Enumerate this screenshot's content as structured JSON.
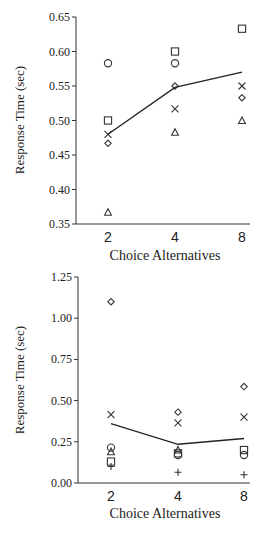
{
  "chart_data": [
    {
      "type": "scatter",
      "title": "",
      "xlabel": "Choice Alternatives",
      "ylabel": "Response Time (sec)",
      "categories": [
        "2",
        "4",
        "8"
      ],
      "ylim": [
        0.35,
        0.65
      ],
      "yticks": [
        "0.35",
        "0.40",
        "0.45",
        "0.50",
        "0.55",
        "0.60",
        "0.65"
      ],
      "grid": false,
      "legend": null,
      "series": [
        {
          "name": "circle",
          "marker": "circle",
          "values": [
            0.583,
            0.583,
            null
          ]
        },
        {
          "name": "square",
          "marker": "square",
          "values": [
            0.5,
            0.6,
            0.633
          ]
        },
        {
          "name": "cross",
          "marker": "x",
          "values": [
            0.48,
            0.517,
            0.55
          ]
        },
        {
          "name": "diamond",
          "marker": "diamond",
          "values": [
            0.467,
            0.55,
            0.533
          ]
        },
        {
          "name": "triangle",
          "marker": "triangle",
          "values": [
            0.367,
            0.483,
            0.5
          ]
        },
        {
          "name": "mean",
          "marker": "line",
          "values": [
            0.48,
            0.548,
            0.57
          ]
        }
      ]
    },
    {
      "type": "scatter",
      "title": "",
      "xlabel": "Choice Alternatives",
      "ylabel": "Response Time (sec)",
      "categories": [
        "2",
        "4",
        "8"
      ],
      "ylim": [
        0.0,
        1.25
      ],
      "yticks": [
        "0.00",
        "0.25",
        "0.50",
        "0.75",
        "1.00",
        "1.25"
      ],
      "grid": false,
      "legend": null,
      "series": [
        {
          "name": "diamond",
          "marker": "diamond",
          "values": [
            1.1,
            0.43,
            0.585
          ]
        },
        {
          "name": "cross",
          "marker": "x",
          "values": [
            0.415,
            0.365,
            0.4
          ]
        },
        {
          "name": "circle",
          "marker": "circle",
          "values": [
            0.215,
            0.17,
            0.17
          ]
        },
        {
          "name": "triangle",
          "marker": "triangle",
          "values": [
            0.19,
            0.2,
            null
          ]
        },
        {
          "name": "square",
          "marker": "square",
          "values": [
            0.13,
            0.18,
            0.2
          ]
        },
        {
          "name": "plus",
          "marker": "plus",
          "values": [
            0.1,
            0.065,
            0.05
          ]
        },
        {
          "name": "mean",
          "marker": "line",
          "values": [
            0.36,
            0.235,
            0.27
          ]
        }
      ]
    }
  ]
}
